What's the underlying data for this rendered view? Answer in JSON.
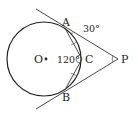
{
  "diagram": {
    "type": "geometry",
    "points": {
      "O": {
        "label": "O",
        "x": 44,
        "y": 59
      },
      "A": {
        "label": "A",
        "x": 66,
        "y": 30
      },
      "B": {
        "label": "B",
        "x": 66,
        "y": 88
      },
      "C": {
        "label": "C",
        "x": 82,
        "y": 59
      },
      "P": {
        "label": "P",
        "x": 118,
        "y": 59
      }
    },
    "circle": {
      "center": "O",
      "radius": 37
    },
    "angles": {
      "tangent_angle": "30°",
      "angle_ACB": "120°"
    },
    "colors": {
      "stroke": "#222222",
      "background": "#ffffff"
    }
  }
}
